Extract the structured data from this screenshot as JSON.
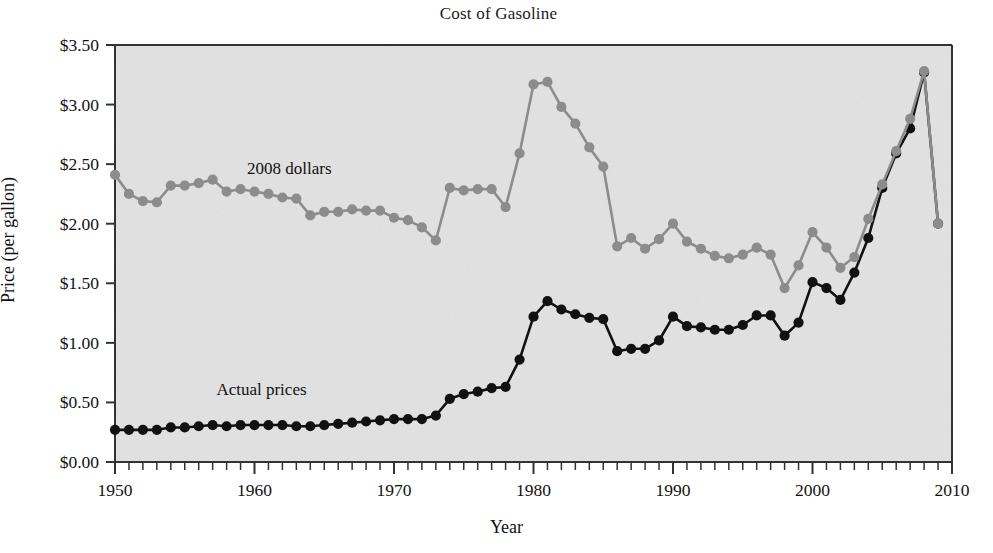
{
  "chart_data": {
    "type": "line",
    "title": "Cost of Gasoline",
    "xlabel": "Year",
    "ylabel": "Price (per gallon)",
    "xlim": [
      1950,
      2010
    ],
    "ylim": [
      0.0,
      3.5
    ],
    "xticks_major": [
      1950,
      1960,
      1970,
      1980,
      1990,
      2000,
      2010
    ],
    "xtick_labels": [
      "1950",
      "1960",
      "1970",
      "1980",
      "1990",
      "2000",
      "2010"
    ],
    "xtick_minor_step": 1,
    "yticks": [
      0.0,
      0.5,
      1.0,
      1.5,
      2.0,
      2.5,
      3.0,
      3.5
    ],
    "ytick_labels": [
      "$0.00",
      "$0.50",
      "$1.00",
      "$1.50",
      "$2.00",
      "$2.50",
      "$3.00",
      "$3.50"
    ],
    "grid": false,
    "legend_position": "inline-annotations",
    "plot_background": "#e2e2e2",
    "x": [
      1950,
      1951,
      1952,
      1953,
      1954,
      1955,
      1956,
      1957,
      1958,
      1959,
      1960,
      1961,
      1962,
      1963,
      1964,
      1965,
      1966,
      1967,
      1968,
      1969,
      1970,
      1971,
      1972,
      1973,
      1974,
      1975,
      1976,
      1977,
      1978,
      1979,
      1980,
      1981,
      1982,
      1983,
      1984,
      1985,
      1986,
      1987,
      1988,
      1989,
      1990,
      1991,
      1992,
      1993,
      1994,
      1995,
      1996,
      1997,
      1998,
      1999,
      2000,
      2001,
      2002,
      2003,
      2004,
      2005,
      2006,
      2007,
      2008,
      2009
    ],
    "series": [
      {
        "name": "2008 dollars",
        "color": "#8c8c8c",
        "annotation": "2008 dollars",
        "annotation_x": 1962.5,
        "annotation_y": 2.42,
        "values": [
          2.41,
          2.25,
          2.19,
          2.18,
          2.32,
          2.32,
          2.34,
          2.37,
          2.27,
          2.29,
          2.27,
          2.25,
          2.22,
          2.21,
          2.07,
          2.1,
          2.1,
          2.12,
          2.11,
          2.11,
          2.05,
          2.03,
          1.97,
          1.86,
          2.3,
          2.28,
          2.29,
          2.29,
          2.14,
          2.59,
          3.17,
          3.19,
          2.98,
          2.84,
          2.64,
          2.48,
          1.81,
          1.88,
          1.79,
          1.87,
          2.0,
          1.85,
          1.79,
          1.73,
          1.71,
          1.74,
          1.8,
          1.74,
          1.46,
          1.65,
          1.93,
          1.8,
          1.63,
          1.72,
          2.04,
          2.33,
          2.61,
          2.88,
          3.28,
          2.0
        ]
      },
      {
        "name": "Actual prices",
        "color": "#111111",
        "annotation": "Actual prices",
        "annotation_x": 1960.5,
        "annotation_y": 0.56,
        "values": [
          0.27,
          0.27,
          0.27,
          0.27,
          0.29,
          0.29,
          0.3,
          0.31,
          0.3,
          0.31,
          0.31,
          0.31,
          0.31,
          0.3,
          0.3,
          0.31,
          0.32,
          0.33,
          0.34,
          0.35,
          0.36,
          0.36,
          0.36,
          0.39,
          0.53,
          0.57,
          0.59,
          0.62,
          0.63,
          0.86,
          1.22,
          1.35,
          1.28,
          1.24,
          1.21,
          1.2,
          0.93,
          0.95,
          0.95,
          1.02,
          1.22,
          1.14,
          1.13,
          1.11,
          1.11,
          1.15,
          1.23,
          1.23,
          1.06,
          1.17,
          1.51,
          1.46,
          1.36,
          1.59,
          1.88,
          2.3,
          2.59,
          2.8,
          3.27,
          2.0
        ]
      }
    ]
  }
}
